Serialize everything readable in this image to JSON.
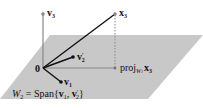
{
  "figure": {
    "plane_color": "#c8c8c8",
    "axis_color": "#888888",
    "vector_color": "#111111",
    "plane": {
      "label_lhs": "W",
      "label_lhs_sub": "2",
      "label_eq": " = Span{",
      "label_v1": "v",
      "label_v1_sub": "1",
      "label_sep": ", ",
      "label_v2": "v",
      "label_v2_sub": "2",
      "label_v2_prime": "′",
      "label_close": "}"
    },
    "origin": {
      "label": "0"
    },
    "v1": {
      "label": "v",
      "sub": "1"
    },
    "v2_prime": {
      "label": "v",
      "sub": "2",
      "prime": "′"
    },
    "v3": {
      "label": "v",
      "sub": "3"
    },
    "x3": {
      "label": "x",
      "sub": "3"
    },
    "projection": {
      "label_prefix": "proj",
      "label_sub_W": "W",
      "label_sub_W_sub": "1",
      "label_x": "x",
      "label_x_sub": "3"
    }
  }
}
